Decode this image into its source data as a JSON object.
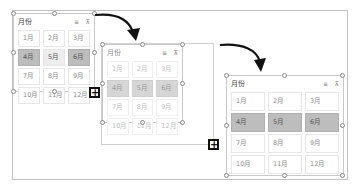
{
  "slicers": [
    {
      "title": "月份",
      "state": "original",
      "items": [
        {
          "label": "1月",
          "state": "normal"
        },
        {
          "label": "2月",
          "state": "normal"
        },
        {
          "label": "3月",
          "state": "normal"
        },
        {
          "label": "4月",
          "state": "selected"
        },
        {
          "label": "5月",
          "state": "hover"
        },
        {
          "label": "6月",
          "state": "selected"
        },
        {
          "label": "7月",
          "state": "normal"
        },
        {
          "label": "8月",
          "state": "normal"
        },
        {
          "label": "9月",
          "state": "normal"
        },
        {
          "label": "10月",
          "state": "normal"
        },
        {
          "label": "11月",
          "state": "normal"
        },
        {
          "label": "12月",
          "state": "normal"
        }
      ]
    },
    {
      "title": "月份",
      "state": "dragging",
      "items": [
        {
          "label": "1月",
          "state": "normal"
        },
        {
          "label": "2月",
          "state": "normal"
        },
        {
          "label": "3月",
          "state": "normal"
        },
        {
          "label": "4月",
          "state": "selected"
        },
        {
          "label": "5月",
          "state": "selected"
        },
        {
          "label": "6月",
          "state": "selected"
        },
        {
          "label": "7月",
          "state": "normal"
        },
        {
          "label": "8月",
          "state": "normal"
        },
        {
          "label": "9月",
          "state": "normal"
        },
        {
          "label": "10月",
          "state": "normal"
        },
        {
          "label": "11月",
          "state": "normal"
        },
        {
          "label": "12月",
          "state": "normal"
        }
      ]
    },
    {
      "title": "月份",
      "state": "resized",
      "items": [
        {
          "label": "1月",
          "state": "normal"
        },
        {
          "label": "2月",
          "state": "normal"
        },
        {
          "label": "3月",
          "state": "normal"
        },
        {
          "label": "4月",
          "state": "selected"
        },
        {
          "label": "5月",
          "state": "selected"
        },
        {
          "label": "6月",
          "state": "selected"
        },
        {
          "label": "7月",
          "state": "normal"
        },
        {
          "label": "8月",
          "state": "normal"
        },
        {
          "label": "9月",
          "state": "normal"
        },
        {
          "label": "10月",
          "state": "normal"
        },
        {
          "label": "11月",
          "state": "normal"
        },
        {
          "label": "12月",
          "state": "normal"
        }
      ]
    }
  ],
  "icons": {
    "multi_select": "≡",
    "clear_filter": "⊼",
    "resize_cursor": "+"
  },
  "colors": {
    "selected_fill": "#bdbdbd",
    "hover_fill": "#ededed",
    "arrow": "#111111"
  }
}
